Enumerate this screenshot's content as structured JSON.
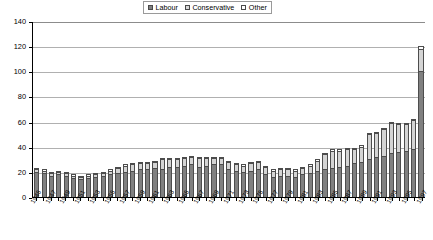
{
  "legend": {
    "items": [
      {
        "label": "Labour",
        "color": "#7f7f7f",
        "key": "labour"
      },
      {
        "label": "Conservative",
        "color": "#d9d9d9",
        "key": "conservative"
      },
      {
        "label": "Other",
        "color": "#ffffff",
        "key": "other"
      }
    ]
  },
  "caption": {
    "text": ""
  },
  "chart_data": {
    "type": "bar",
    "stacked": true,
    "title": "",
    "subtitle": "",
    "xlabel": "",
    "ylabel": "",
    "ylim": [
      0,
      140
    ],
    "ytick_step": 20,
    "yticks": [
      0,
      20,
      40,
      60,
      80,
      100,
      120,
      140
    ],
    "grid": true,
    "legend_position": "top-center",
    "x": [
      1945,
      1946,
      1947,
      1948,
      1949,
      1950,
      1951,
      1952,
      1953,
      1954,
      1955,
      1956,
      1957,
      1958,
      1959,
      1960,
      1961,
      1962,
      1963,
      1964,
      1965,
      1966,
      1967,
      1968,
      1969,
      1970,
      1971,
      1972,
      1973,
      1974,
      1975,
      1976,
      1977,
      1978,
      1979,
      1980,
      1981,
      1982,
      1983,
      1984,
      1985,
      1986,
      1987,
      1988,
      1989,
      1990,
      1991,
      1992,
      1993,
      1994,
      1995,
      1996,
      1997
    ],
    "categories": [
      "1945",
      "1946",
      "1947",
      "1948",
      "1949",
      "1950",
      "1951",
      "1952",
      "1953",
      "1954",
      "1955",
      "1956",
      "1957",
      "1958",
      "1959",
      "1960",
      "1961",
      "1962",
      "1963",
      "1964",
      "1965",
      "1966",
      "1967",
      "1968",
      "1969",
      "1970",
      "1971",
      "1972",
      "1973",
      "1974",
      "1975",
      "1976",
      "1977",
      "1978",
      "1979",
      "1980",
      "1981",
      "1982",
      "1983",
      "1984",
      "1985",
      "1986",
      "1987",
      "1988",
      "1989",
      "1990",
      "1991",
      "1992",
      "1993",
      "1994",
      "1995",
      "1996",
      "1997"
    ],
    "tick_labels": [
      "1945",
      "",
      "1947",
      "",
      "1949",
      "",
      "1951",
      "",
      "1953",
      "",
      "1955",
      "",
      "1957",
      "",
      "1959",
      "",
      "1961",
      "",
      "1963",
      "",
      "1965",
      "",
      "1967",
      "",
      "1969",
      "",
      "1971",
      "",
      "1973",
      "",
      "1975",
      "",
      "1977",
      "",
      "1979",
      "",
      "1981",
      "",
      "1983",
      "",
      "1985",
      "",
      "1987",
      "",
      "1989",
      "",
      "1991",
      "",
      "1993",
      "",
      "1995",
      "",
      "1997"
    ],
    "series": [
      {
        "name": "Labour",
        "color": "#808080",
        "values": [
          20,
          19,
          17,
          18,
          17,
          15,
          14,
          15,
          16,
          17,
          18,
          19,
          20,
          21,
          22,
          22,
          23,
          22,
          24,
          24,
          25,
          26,
          24,
          25,
          26,
          26,
          22,
          21,
          20,
          21,
          22,
          18,
          16,
          17,
          17,
          16,
          18,
          19,
          21,
          22,
          23,
          24,
          25,
          27,
          28,
          30,
          32,
          33,
          35,
          36,
          37,
          38,
          100
        ]
      },
      {
        "name": "Conservative",
        "color": "#d4d4d4",
        "values": [
          2,
          2,
          2,
          2,
          2,
          2,
          2,
          2,
          2,
          2,
          3,
          4,
          5,
          5,
          5,
          5,
          5,
          8,
          6,
          6,
          6,
          6,
          7,
          6,
          5,
          5,
          6,
          5,
          5,
          6,
          6,
          6,
          5,
          5,
          5,
          5,
          5,
          6,
          8,
          12,
          14,
          13,
          13,
          11,
          12,
          20,
          19,
          21,
          24,
          22,
          21,
          23,
          18
        ]
      },
      {
        "name": "Other",
        "color": "#ffffff",
        "values": [
          1,
          1,
          1,
          1,
          1,
          1,
          1,
          1,
          1,
          1,
          1,
          1,
          1,
          1,
          1,
          1,
          1,
          1,
          1,
          1,
          1,
          1,
          1,
          1,
          1,
          1,
          1,
          1,
          1,
          1,
          1,
          1,
          1,
          1,
          1,
          1,
          1,
          1,
          1,
          1,
          1,
          1,
          1,
          1,
          1,
          1,
          1,
          1,
          1,
          1,
          1,
          1,
          2
        ]
      }
    ],
    "totals": [
      23,
      22,
      20,
      21,
      20,
      18,
      17,
      18,
      19,
      20,
      22,
      24,
      26,
      27,
      28,
      28,
      29,
      31,
      31,
      31,
      32,
      33,
      32,
      32,
      32,
      32,
      29,
      27,
      26,
      28,
      29,
      25,
      22,
      23,
      23,
      22,
      24,
      26,
      30,
      35,
      38,
      38,
      39,
      39,
      41,
      51,
      52,
      55,
      60,
      59,
      59,
      62,
      120
    ]
  }
}
